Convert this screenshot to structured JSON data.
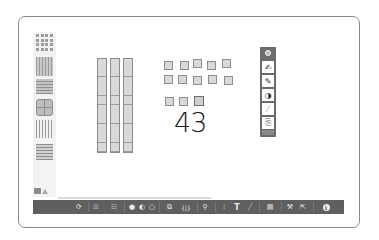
{
  "sidebar": {
    "items": [
      {
        "name": "units",
        "icon": "unit-blocks-icon"
      },
      {
        "name": "rods",
        "icon": "ten-rods-icon"
      },
      {
        "name": "flats",
        "icon": "hundred-flats-icon"
      },
      {
        "name": "cube",
        "icon": "thousand-cube-icon"
      },
      {
        "name": "rods-outline",
        "icon": "rods-outline-icon"
      },
      {
        "name": "flats-outline",
        "icon": "flats-outline-icon"
      }
    ],
    "bottom_icons": [
      "cube-icon",
      "triangle-icon"
    ]
  },
  "canvas": {
    "rods_count": 3,
    "units_count": 13,
    "handwritten_number": "43"
  },
  "float_tools": {
    "items": [
      {
        "name": "settings",
        "glyph": "⚙"
      },
      {
        "name": "pen-fine",
        "glyph": "✍"
      },
      {
        "name": "pen",
        "glyph": "✎"
      },
      {
        "name": "color",
        "glyph": "◑"
      },
      {
        "name": "eraser",
        "glyph": "⁄"
      },
      {
        "name": "note",
        "glyph": "⎘"
      }
    ]
  },
  "toolbar": {
    "items": [
      {
        "name": "reset",
        "glyph": "⟳"
      },
      {
        "name": "grid-small",
        "glyph": "⊞"
      },
      {
        "name": "grid-large",
        "glyph": "⊟"
      },
      {
        "name": "fill-dark",
        "glyph": "●"
      },
      {
        "name": "fill-medium",
        "glyph": "◐"
      },
      {
        "name": "fill-light",
        "glyph": "○"
      },
      {
        "name": "duplicate",
        "glyph": "⧉"
      },
      {
        "name": "group",
        "glyph": "{|}"
      },
      {
        "name": "zoom",
        "glyph": "⚲"
      },
      {
        "name": "columns",
        "glyph": "⁝"
      },
      {
        "name": "text",
        "glyph": "T"
      },
      {
        "name": "pencil",
        "glyph": "╱"
      },
      {
        "name": "trash",
        "glyph": "▤"
      },
      {
        "name": "tools",
        "glyph": "⚒"
      },
      {
        "name": "export",
        "glyph": "⇱"
      },
      {
        "name": "info",
        "glyph": "ℹ"
      }
    ]
  },
  "colors": {
    "toolbar_bg": "#5f5f5f",
    "block_fill": "#d9d9d9",
    "block_border": "#8d8d8d",
    "frame_border": "#8a8a8a"
  }
}
